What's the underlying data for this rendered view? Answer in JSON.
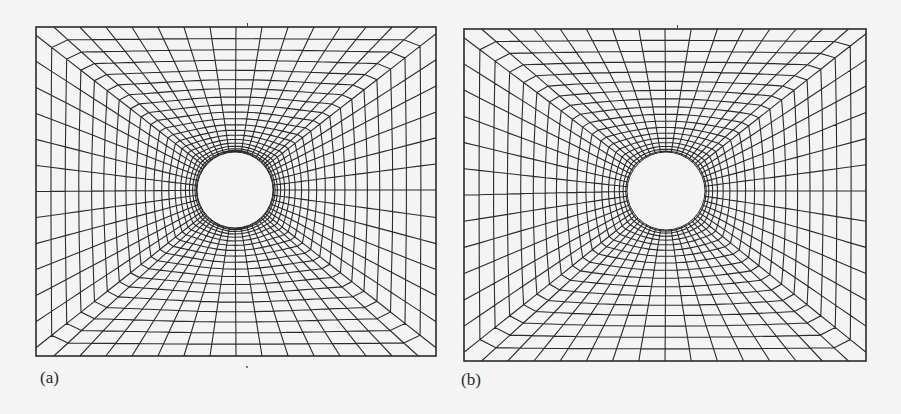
{
  "figure": {
    "background": "#f4f4f4",
    "line_color": "#2b2b2b",
    "panels": [
      {
        "id": "a",
        "label": "(a)",
        "frame": {
          "x": 36,
          "y": 27,
          "w": 400,
          "h": 329
        },
        "hole": {
          "cx": 235,
          "cy": 190,
          "r": 38
        },
        "radial_lines": 56,
        "rings": 20,
        "grading": 1.9,
        "style": "straight-ray",
        "label_pos": {
          "x": 40,
          "y": 378
        }
      },
      {
        "id": "b",
        "label": "(b)",
        "frame": {
          "x": 464,
          "y": 29,
          "w": 402,
          "h": 332
        },
        "hole": {
          "cx": 666,
          "cy": 191,
          "r": 39
        },
        "radial_lines": 56,
        "rings": 18,
        "grading": 1.7,
        "style": "smoothed",
        "label_pos": {
          "x": 461,
          "y": 380
        }
      }
    ]
  }
}
